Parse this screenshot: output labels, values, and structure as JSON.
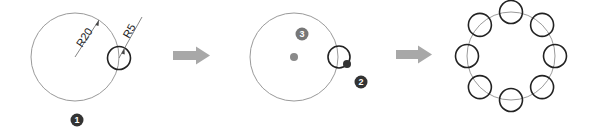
{
  "diagram": {
    "colors": {
      "guide_circle": "#9a9a9a",
      "small_circle": "#222222",
      "arrow": "#a8a8a8",
      "badge_dark": "#333333",
      "badge_gray": "#777777",
      "center_dot": "#8a8a8a",
      "pivot_dot": "#333333",
      "dimension_line": "#555555"
    },
    "step1": {
      "big_circle": {
        "cx": 75,
        "cy": 57,
        "r": 44
      },
      "small_circle": {
        "cx": 119,
        "cy": 58,
        "r": 11.5
      },
      "dim_big_label": "R20",
      "dim_small_label": "R5",
      "badge": {
        "label": "1",
        "cx": 77,
        "cy": 120
      }
    },
    "arrow1": {
      "label": "next-step-arrow"
    },
    "step2": {
      "big_circle": {
        "cx": 294,
        "cy": 57,
        "r": 44
      },
      "small_circle": {
        "cx": 339,
        "cy": 57,
        "r": 11
      },
      "center_dot": {
        "cx": 294,
        "cy": 57,
        "r": 4
      },
      "pivot_dot": {
        "cx": 347,
        "cy": 64,
        "r": 4
      },
      "badge_pivot": {
        "label": "2",
        "cx": 361,
        "cy": 82
      },
      "badge_center": {
        "label": "3",
        "cx": 302,
        "cy": 34
      }
    },
    "arrow2": {
      "label": "next-step-arrow"
    },
    "step3": {
      "big_circle": {
        "cx": 511,
        "cy": 56,
        "r": 44
      },
      "array_count": 8,
      "small_r": 11.5
    }
  }
}
